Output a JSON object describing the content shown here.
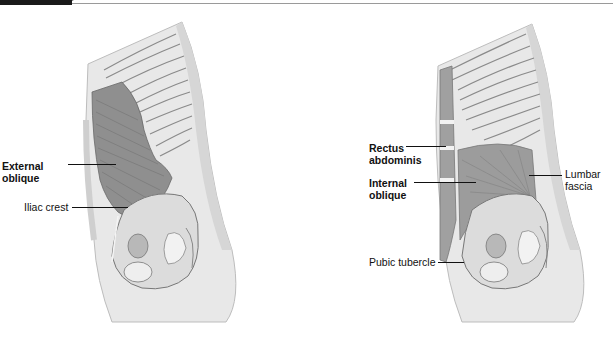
{
  "header": {
    "tab_color": "#1a1a1a",
    "rule_color": "#9a9a9a"
  },
  "figures": [
    {
      "view": "lateral-torso-superficial",
      "labels": [
        {
          "id": "external-oblique",
          "line1": "External",
          "line2": "oblique",
          "bold": true
        },
        {
          "id": "iliac-crest",
          "line1": "Iliac crest",
          "bold": false
        }
      ]
    },
    {
      "view": "lateral-torso-deep",
      "labels": [
        {
          "id": "rectus-abdominis",
          "line1": "Rectus",
          "line2": "abdominis",
          "bold": true
        },
        {
          "id": "internal-oblique",
          "line1": "Internal",
          "line2": "oblique",
          "bold": true
        },
        {
          "id": "lumbar-fascia",
          "line1": "Lumbar",
          "line2": "fascia",
          "bold": false
        },
        {
          "id": "pubic-tubercle",
          "line1": "Pubic tubercle",
          "bold": false
        }
      ]
    }
  ],
  "colors": {
    "skin": "#e6e6e6",
    "skin_edge": "#bdbdbd",
    "muscle_dark": "#8c8c8c",
    "rib": "#d4d4d4",
    "rib_line": "#8a8a8a",
    "bone": "#dcdcdc"
  }
}
